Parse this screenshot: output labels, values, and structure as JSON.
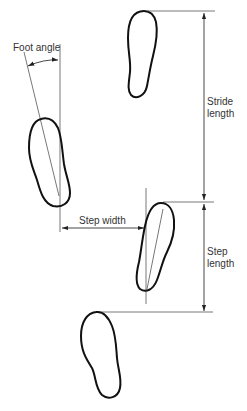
{
  "diagram": {
    "type": "gait-footprint-parameters",
    "labels": {
      "foot_angle": "Foot angle",
      "stride_length_line1": "Stride",
      "stride_length_line2": "length",
      "step_width": "Step width",
      "step_length_line1": "Step",
      "step_length_line2": "length"
    },
    "footprints": [
      {
        "id": "top-right",
        "side": "right"
      },
      {
        "id": "left-upper",
        "side": "left"
      },
      {
        "id": "right-middle",
        "side": "right"
      },
      {
        "id": "left-lower",
        "side": "left"
      }
    ],
    "colors": {
      "outline": "#111111",
      "guide_line": "#555555",
      "text": "#333333",
      "background": "#ffffff"
    }
  }
}
